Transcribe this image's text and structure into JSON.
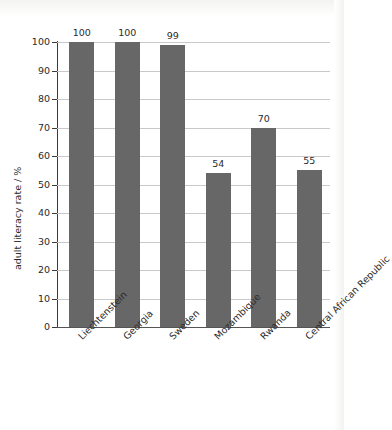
{
  "chart_data": {
    "type": "bar",
    "title": "",
    "subtitle": "",
    "xlabel": "",
    "ylabel": "adult literacy rate / %",
    "categories": [
      "Liechtenstein",
      "Georgia",
      "Sweden",
      "Mozambique",
      "Rwanda",
      "Central African Republic"
    ],
    "values": [
      100,
      100,
      99,
      54,
      70,
      55
    ],
    "value_labels": [
      "100",
      "100",
      "99",
      "54",
      "70",
      "55"
    ],
    "ylim": [
      0,
      100
    ],
    "ytick_labels": [
      "0",
      "10",
      "20",
      "30",
      "40",
      "50",
      "60",
      "70",
      "80",
      "90",
      "100"
    ],
    "ytick_values": [
      0,
      10,
      20,
      30,
      40,
      50,
      60,
      70,
      80,
      90,
      100
    ],
    "grid": true,
    "legend": false,
    "legend_position": "none",
    "bar_color": "#676767",
    "gridline_color": "#c9c9c9",
    "axis_color": "#3a3a3a",
    "background_color": "#ffffff",
    "xtick_label_rotation": -45
  }
}
